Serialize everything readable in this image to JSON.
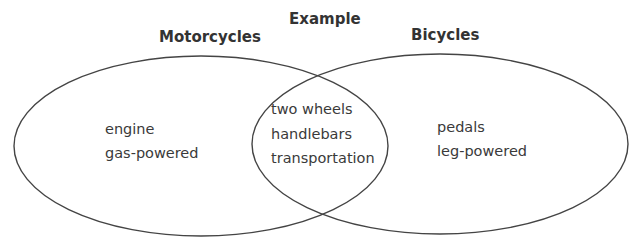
{
  "diagram": {
    "title": "Example",
    "type": "venn",
    "line_color": "#444444",
    "sets": [
      {
        "name": "Motorcycles",
        "unique_items": [
          "engine",
          "gas-powered"
        ]
      },
      {
        "name": "Bicycles",
        "unique_items": [
          "pedals",
          "leg-powered"
        ]
      }
    ],
    "intersection": {
      "items": [
        "two wheels",
        "handlebars",
        "transportation"
      ]
    }
  }
}
